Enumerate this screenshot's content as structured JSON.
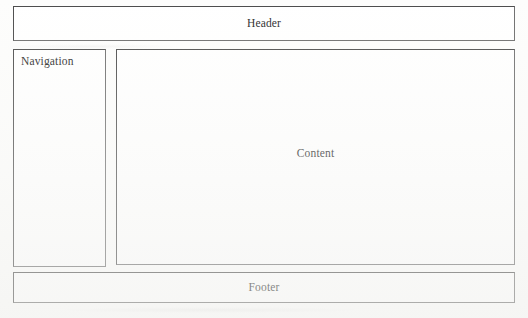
{
  "diagram": {
    "type": "page-layout-wireframe",
    "regions": [
      {
        "id": "header",
        "label": "Header",
        "align": "center",
        "x": 13,
        "y": 6,
        "width": 502,
        "height": 35
      },
      {
        "id": "navigation",
        "label": "Navigation",
        "align": "left",
        "x": 13,
        "y": 49,
        "width": 93,
        "height": 218
      },
      {
        "id": "content",
        "label": "Content",
        "align": "center",
        "x": 116,
        "y": 49,
        "width": 399,
        "height": 216
      },
      {
        "id": "footer",
        "label": "Footer",
        "align": "center",
        "x": 13,
        "y": 272,
        "width": 502,
        "height": 31
      }
    ],
    "colors": {
      "page_background": "#fdfdfc",
      "box_fill": "#ffffff",
      "box_border": "#4c4c4c",
      "text": "#2a2a2a"
    }
  }
}
